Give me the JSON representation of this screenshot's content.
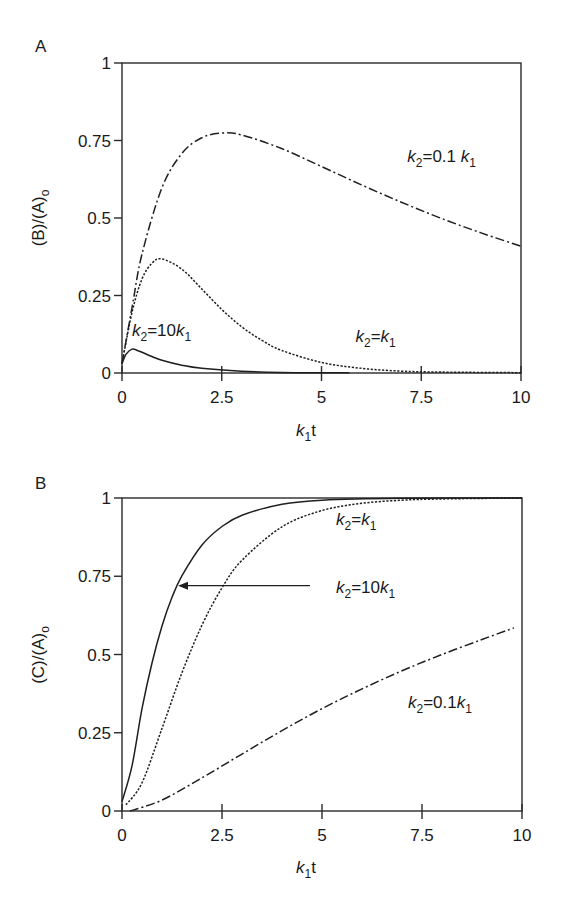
{
  "chart_data": [
    {
      "panel": "A",
      "type": "line",
      "title": "",
      "xlabel": "k1t",
      "ylabel": "(B)/(A)o",
      "xlim": [
        0,
        10
      ],
      "ylim": [
        0,
        1
      ],
      "xticks": [
        0,
        2.5,
        5,
        7.5,
        10
      ],
      "yticks": [
        0,
        0.25,
        0.5,
        0.75,
        1
      ],
      "xtick_labels": [
        "0",
        "2.5",
        "5",
        "7.5",
        "10"
      ],
      "ytick_labels": [
        "0",
        "0.25",
        "0.5",
        "0.75",
        "1"
      ],
      "grid": false,
      "series": [
        {
          "name": "k2 = 0.1 k1",
          "style": "dashdot",
          "x": [
            0,
            0.25,
            0.5,
            1,
            1.5,
            2,
            2.5,
            3,
            4,
            5,
            6,
            7,
            8,
            9,
            10
          ],
          "y": [
            0.03,
            0.21,
            0.383,
            0.597,
            0.708,
            0.759,
            0.774,
            0.768,
            0.724,
            0.666,
            0.607,
            0.551,
            0.499,
            0.452,
            0.409
          ]
        },
        {
          "name": "k2 = k1",
          "style": "dotted",
          "x": [
            0,
            0.25,
            0.5,
            0.75,
            1,
            1.5,
            2,
            2.5,
            3,
            3.5,
            4,
            5,
            6,
            7,
            8,
            10
          ],
          "y": [
            0.03,
            0.195,
            0.303,
            0.354,
            0.368,
            0.335,
            0.271,
            0.205,
            0.149,
            0.106,
            0.073,
            0.034,
            0.015,
            0.006,
            0.003,
            0.001
          ]
        },
        {
          "name": "k2 = 10k1",
          "style": "solid",
          "x": [
            0,
            0.1,
            0.25,
            0.4,
            0.5,
            0.75,
            1,
            1.5,
            2,
            3,
            4,
            5,
            5.7
          ],
          "y": [
            0.03,
            0.06,
            0.077,
            0.072,
            0.067,
            0.053,
            0.041,
            0.025,
            0.015,
            0.006,
            0.002,
            0.001,
            0.001
          ]
        }
      ],
      "annotations": [
        {
          "text_main": "k",
          "sub1": "2",
          "text_mid": "=0.1 ",
          "text_k": "k",
          "sub2": "1",
          "x": 6.9,
          "y": 0.68
        },
        {
          "text_main": "k",
          "sub1": "2",
          "text_mid": "=10",
          "text_k": "k",
          "sub2": "1",
          "x": 0.0,
          "y": 0.12
        },
        {
          "text_main": "k",
          "sub1": "2",
          "text_mid": "=",
          "text_k": "k",
          "sub2": "1",
          "x": 5.6,
          "y": 0.1
        }
      ]
    },
    {
      "panel": "B",
      "type": "line",
      "title": "",
      "xlabel": "k1t",
      "ylabel": "(C)/(A)o",
      "xlim": [
        0,
        10
      ],
      "ylim": [
        0,
        1
      ],
      "xticks": [
        0,
        2.5,
        5,
        7.5,
        10
      ],
      "yticks": [
        0,
        0.25,
        0.5,
        0.75,
        1
      ],
      "xtick_labels": [
        "0",
        "2.5",
        "5",
        "7.5",
        "10"
      ],
      "ytick_labels": [
        "0",
        "0.25",
        "0.5",
        "0.75",
        "1"
      ],
      "grid": false,
      "series": [
        {
          "name": "k2 = 10k1",
          "style": "solid",
          "x": [
            0,
            0.25,
            0.5,
            0.75,
            1,
            1.25,
            1.5,
            2,
            2.5,
            3,
            4,
            5,
            7,
            10
          ],
          "y": [
            0.03,
            0.144,
            0.327,
            0.473,
            0.591,
            0.683,
            0.752,
            0.85,
            0.909,
            0.945,
            0.98,
            0.993,
            0.999,
            1.0
          ]
        },
        {
          "name": "k2 = k1",
          "style": "dotted",
          "x": [
            0.1,
            0.5,
            1,
            1.5,
            2,
            2.5,
            3,
            4,
            5,
            6,
            7,
            8,
            10
          ],
          "y": [
            0.02,
            0.09,
            0.264,
            0.442,
            0.594,
            0.713,
            0.801,
            0.908,
            0.96,
            0.983,
            0.993,
            0.997,
            1.0
          ]
        },
        {
          "name": "k2 = 0.1k1",
          "style": "dashdot",
          "x": [
            0.2,
            1,
            2,
            3,
            4,
            5,
            6,
            7,
            8,
            9,
            9.8
          ],
          "y": [
            0.0,
            0.035,
            0.106,
            0.182,
            0.257,
            0.327,
            0.39,
            0.448,
            0.5,
            0.548,
            0.585
          ]
        }
      ],
      "annotations": [
        {
          "text_main": "k",
          "sub1": "2",
          "text_mid": "=",
          "text_k": "k",
          "sub2": "1",
          "x": 5.1,
          "y": 0.915
        },
        {
          "text_main": "k",
          "sub1": "2",
          "text_mid": "=10",
          "text_k": "k",
          "sub2": "1",
          "x": 5.1,
          "y": 0.695,
          "arrow_from_x": 4.7,
          "arrow_to_x": 1.4,
          "arrow_y": 0.72
        },
        {
          "text_main": "k",
          "sub1": "2",
          "text_mid": "=0.1",
          "text_k": "k",
          "sub2": "1",
          "x": 6.9,
          "y": 0.33
        }
      ]
    }
  ]
}
